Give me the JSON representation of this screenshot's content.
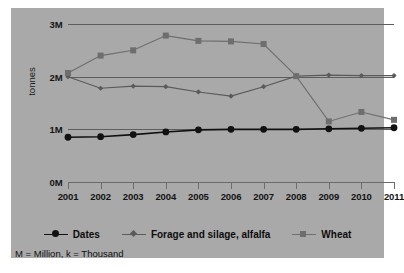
{
  "chart_data": {
    "type": "line",
    "title": "",
    "xlabel": "",
    "ylabel": "tonnes",
    "x": [
      2001,
      2002,
      2003,
      2004,
      2005,
      2006,
      2007,
      2008,
      2009,
      2010,
      2011
    ],
    "xtick_labels": [
      "2001",
      "2002",
      "2003",
      "2004",
      "2005",
      "2006",
      "2007",
      "2008",
      "2009",
      "2010",
      "2011"
    ],
    "ytick_labels": [
      "0M",
      "1M",
      "2M",
      "3M"
    ],
    "ytick_values": [
      0,
      1000000,
      2000000,
      3000000
    ],
    "ylim": [
      0,
      3000000
    ],
    "grid": true,
    "legend_position": "bottom",
    "series": [
      {
        "name": "Dates",
        "marker": "circle",
        "color": "#111111",
        "values": [
          850000,
          860000,
          900000,
          950000,
          990000,
          1000000,
          1000000,
          1000000,
          1010000,
          1020000,
          1030000
        ]
      },
      {
        "name": "Forage and silage, alfalfa",
        "marker": "diamond",
        "color": "#5a5a5a",
        "values": [
          2000000,
          1780000,
          1820000,
          1810000,
          1710000,
          1630000,
          1810000,
          2010000,
          2030000,
          2020000,
          2020000
        ]
      },
      {
        "name": "Wheat",
        "marker": "square",
        "color": "#6e6e6e",
        "values": [
          2070000,
          2400000,
          2500000,
          2780000,
          2680000,
          2670000,
          2620000,
          2010000,
          1150000,
          1330000,
          1180000
        ]
      }
    ],
    "footnote": "M = Million, k = Thousand"
  },
  "colors": {
    "page_background": "#ffffff",
    "panel_background": "#a9a9a9",
    "gridline": "#5e5e5e",
    "dates": "#111111",
    "forage": "#5a5a5a",
    "wheat": "#6e6e6e",
    "text": "#111111"
  }
}
